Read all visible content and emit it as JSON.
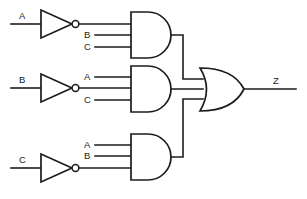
{
  "diagram": {
    "output_expression": "Z",
    "stroke_color": "#1c1c1c",
    "background_color": "#ffffff"
  },
  "inverters": [
    {
      "id": "inv-a",
      "input_label": "A",
      "row": "top"
    },
    {
      "id": "inv-b",
      "input_label": "B",
      "row": "middle"
    },
    {
      "id": "inv-c",
      "input_label": "C",
      "row": "bottom"
    }
  ],
  "and_gates": [
    {
      "id": "and-1",
      "row": "top",
      "inputs": [
        "A-inverted",
        "B",
        "C"
      ],
      "visible_input_labels": [
        "B",
        "C"
      ]
    },
    {
      "id": "and-2",
      "row": "middle",
      "inputs": [
        "A",
        "B-inverted",
        "C"
      ],
      "visible_input_labels": [
        "A",
        "C"
      ]
    },
    {
      "id": "and-3",
      "row": "bottom",
      "inputs": [
        "A",
        "B",
        "C-inverted"
      ],
      "visible_input_labels": [
        "A",
        "B"
      ]
    }
  ],
  "or_gate": {
    "id": "or-1",
    "input_count": 3,
    "output_label": "Z"
  },
  "labels": {
    "input_a_top": "A",
    "input_b_middle": "B",
    "input_c_bottom": "C",
    "and1_in_b": "B",
    "and1_in_c": "C",
    "and2_in_a": "A",
    "and2_in_c": "C",
    "and3_in_a": "A",
    "and3_in_b": "B",
    "output_z": "Z"
  }
}
